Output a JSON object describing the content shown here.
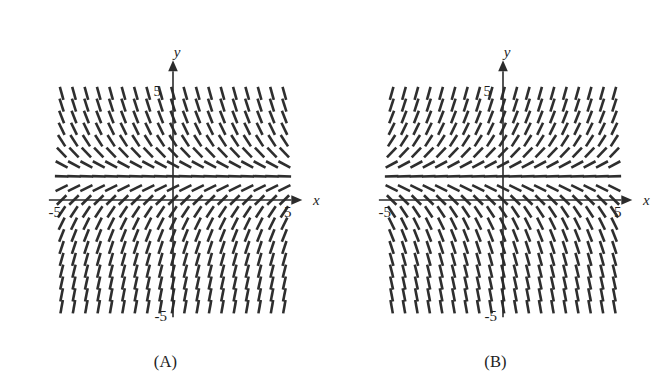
{
  "figure": {
    "panels": [
      {
        "id": "A",
        "caption": "(A)",
        "axis": {
          "x_label": "x",
          "y_label": "y",
          "x_min_label": "-5",
          "x_max_label": "5",
          "y_max_label": "5",
          "y_min_label": "-5",
          "x_range": [
            -5,
            5
          ],
          "y_range": [
            -5,
            5
          ]
        },
        "field": {
          "description": "Slope field with horizontal isocline at y = 1; slopes positive below the isocline and negative above it, steepening with distance from it.",
          "isocline_y": 1,
          "slope_rule": "m = 1 - y",
          "nx": 19,
          "ny": 19,
          "grid_x_min": -4.8,
          "grid_x_max": 4.8,
          "grid_y_min": -4.6,
          "grid_y_max": 4.6
        }
      },
      {
        "id": "B",
        "caption": "(B)",
        "axis": {
          "x_label": "x",
          "y_label": "y",
          "x_min_label": "-5",
          "x_max_label": "5",
          "y_max_label": "5",
          "y_min_label": "-5",
          "x_range": [
            -5,
            5
          ],
          "y_range": [
            -5,
            5
          ]
        },
        "field": {
          "description": "Slope field with horizontal isocline at y = -1; slopes positive above the isocline and negative below it, steepening with distance from it.",
          "isocline_y": -1,
          "slope_rule": "m = -1 - y",
          "nx": 19,
          "ny": 19,
          "grid_x_min": -4.8,
          "grid_x_max": 4.8,
          "grid_y_min": -4.6,
          "grid_y_max": 4.6
        }
      }
    ],
    "colors": {
      "background": "#ffffff",
      "axis": "#2b2b2b",
      "segment": "#2e2e2e",
      "text": "#1f1f1f"
    }
  },
  "chart_data": {
    "type": "scatter",
    "xlabel": "x",
    "ylabel": "y",
    "xlim": [
      -5,
      5
    ],
    "ylim": [
      -5,
      5
    ],
    "grid": false,
    "legend": "none",
    "panels": [
      {
        "name": "(A)",
        "slope_rule": "dy/dx = 1 - y",
        "isocline_zero_slope_at_y": 1,
        "x": [
          -4.8,
          -4.267,
          -3.733,
          -3.2,
          -2.667,
          -2.133,
          -1.6,
          -1.067,
          -0.533,
          0,
          0.533,
          1.067,
          1.6,
          2.133,
          2.667,
          3.2,
          3.733,
          4.267,
          4.8
        ],
        "y": [
          -4.6,
          -4.089,
          -3.578,
          -3.067,
          -2.556,
          -2.044,
          -1.533,
          -1.022,
          -0.511,
          0,
          0.511,
          1.022,
          1.533,
          2.044,
          2.556,
          3.067,
          3.578,
          4.089,
          4.6
        ],
        "slopes_by_row_y": [
          {
            "y": 4.6,
            "slope": -3.6
          },
          {
            "y": 4.089,
            "slope": -3.089
          },
          {
            "y": 3.578,
            "slope": -2.578
          },
          {
            "y": 3.067,
            "slope": -2.067
          },
          {
            "y": 2.556,
            "slope": -1.556
          },
          {
            "y": 2.044,
            "slope": -1.044
          },
          {
            "y": 1.533,
            "slope": -0.533
          },
          {
            "y": 1.022,
            "slope": -0.022
          },
          {
            "y": 0.511,
            "slope": 0.489
          },
          {
            "y": 0.0,
            "slope": 1.0
          },
          {
            "y": -0.511,
            "slope": 1.511
          },
          {
            "y": -1.022,
            "slope": 2.022
          },
          {
            "y": -1.533,
            "slope": 2.533
          },
          {
            "y": -2.044,
            "slope": 3.044
          },
          {
            "y": -2.556,
            "slope": 3.556
          },
          {
            "y": -3.067,
            "slope": 4.067
          },
          {
            "y": -3.578,
            "slope": 4.578
          },
          {
            "y": -4.089,
            "slope": 5.089
          },
          {
            "y": -4.6,
            "slope": 5.6
          }
        ]
      },
      {
        "name": "(B)",
        "slope_rule": "dy/dx = -1 - y",
        "isocline_zero_slope_at_y": -1,
        "x": [
          -4.8,
          -4.267,
          -3.733,
          -3.2,
          -2.667,
          -2.133,
          -1.6,
          -1.067,
          -0.533,
          0,
          0.533,
          1.067,
          1.6,
          2.133,
          2.667,
          3.2,
          3.733,
          4.267,
          4.8
        ],
        "y": [
          -4.6,
          -4.089,
          -3.578,
          -3.067,
          -2.556,
          -2.044,
          -1.533,
          -1.022,
          -0.511,
          0,
          0.511,
          1.022,
          1.533,
          2.044,
          2.556,
          3.067,
          3.578,
          4.089,
          4.6
        ],
        "slopes_by_row_y": [
          {
            "y": 4.6,
            "slope": 3.6
          },
          {
            "y": 4.089,
            "slope": 3.089
          },
          {
            "y": 3.578,
            "slope": 2.578
          },
          {
            "y": 3.067,
            "slope": 2.067
          },
          {
            "y": 2.556,
            "slope": 1.556
          },
          {
            "y": 2.044,
            "slope": 1.044
          },
          {
            "y": 1.533,
            "slope": 0.533
          },
          {
            "y": 1.022,
            "slope": 0.022
          },
          {
            "y": 0.511,
            "slope": -0.489
          },
          {
            "y": 0.0,
            "slope": -1.0
          },
          {
            "y": -0.511,
            "slope": -1.511
          },
          {
            "y": -1.022,
            "slope": -2.022
          },
          {
            "y": -1.533,
            "slope": -2.533
          },
          {
            "y": -2.044,
            "slope": -3.044
          },
          {
            "y": -2.556,
            "slope": -3.556
          },
          {
            "y": -3.067,
            "slope": -4.067
          },
          {
            "y": -3.578,
            "slope": -4.578
          },
          {
            "y": -4.089,
            "slope": -5.089
          },
          {
            "y": -4.6,
            "slope": -5.6
          }
        ]
      }
    ]
  }
}
